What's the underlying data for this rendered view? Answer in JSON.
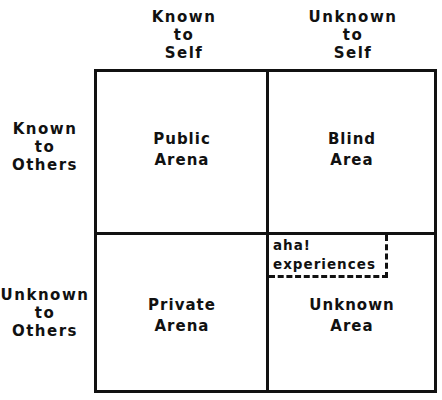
{
  "diagram": {
    "type": "johari-window",
    "column_headers": [
      {
        "lines": "Known\nto\nSelf"
      },
      {
        "lines": "Unknown\nto\nSelf"
      }
    ],
    "row_headers": [
      {
        "lines": "Known\nto\nOthers"
      },
      {
        "lines": "Unknown\nto\nOthers"
      }
    ],
    "cells": {
      "top_left": "Public\nArena",
      "top_right": "Blind\nArea",
      "bottom_left": "Private\nArena",
      "bottom_right": "Unknown\nArea"
    },
    "annotation": {
      "text": "aha!\nexperiences",
      "style": "dashed-box",
      "location": "bottom_right top-left corner"
    },
    "colors": {
      "line": "#111111",
      "background": "#ffffff"
    }
  }
}
